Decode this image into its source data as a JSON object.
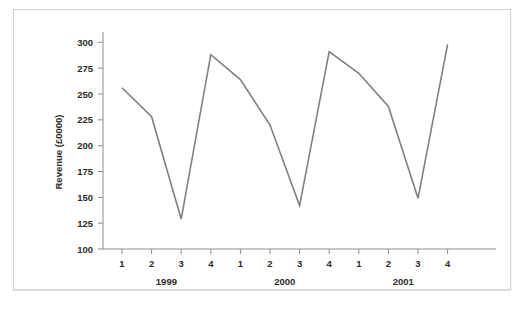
{
  "figure": {
    "background_color": "#ffffff",
    "frame_color": "#d2d2d2",
    "y_axis_title": "Revenue (£0000)"
  },
  "chart_data": {
    "type": "line",
    "title": "",
    "subtitle": "",
    "xlabel": "",
    "ylabel": "Revenue (£0000)",
    "ylim": [
      100,
      310
    ],
    "yticks": [
      100,
      125,
      150,
      175,
      200,
      225,
      250,
      275,
      300
    ],
    "ytick_labels": [
      "100",
      "125",
      "150",
      "175",
      "200",
      "225",
      "250",
      "275",
      "300"
    ],
    "grid": false,
    "legend": "none",
    "x": [
      "1",
      "2",
      "3",
      "4",
      "1",
      "2",
      "3",
      "4",
      "1",
      "2",
      "3",
      "4"
    ],
    "categories": [
      "1",
      "2",
      "3",
      "4",
      "1",
      "2",
      "3",
      "4",
      "1",
      "2",
      "3",
      "4"
    ],
    "values": [
      256,
      228,
      129,
      288,
      264,
      220,
      142,
      291,
      270,
      238,
      149,
      298
    ],
    "series": [
      {
        "name": "Revenue",
        "color": "#808080",
        "values": [
          256,
          228,
          129,
          288,
          264,
          220,
          142,
          291,
          270,
          238,
          149,
          298
        ]
      }
    ],
    "x_groups": [
      {
        "label": "1999",
        "quarters": [
          "1",
          "2",
          "3",
          "4"
        ]
      },
      {
        "label": "2000",
        "quarters": [
          "1",
          "2",
          "3",
          "4"
        ]
      },
      {
        "label": "2001",
        "quarters": [
          "1",
          "2",
          "3",
          "4"
        ]
      }
    ],
    "group_labels": [
      "1999",
      "2000",
      "2001"
    ],
    "line_color": "#808080",
    "axis_color": "#8c8c8c"
  }
}
